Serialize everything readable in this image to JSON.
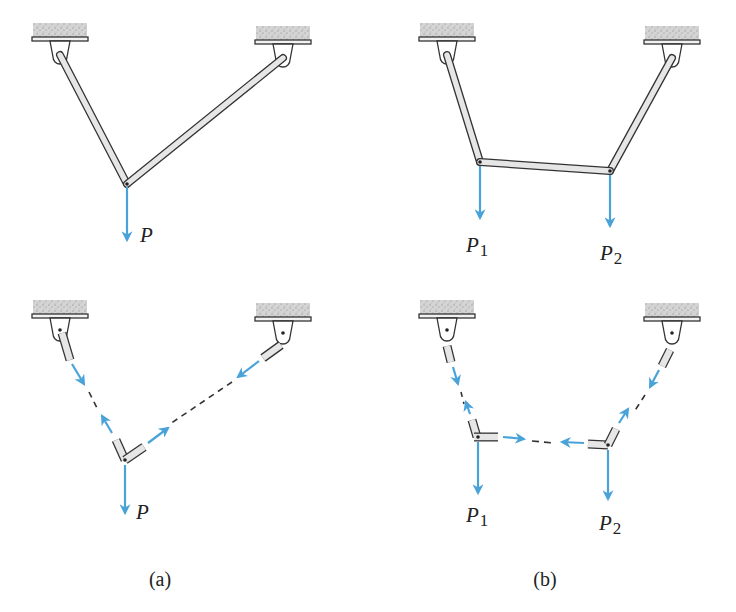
{
  "figure": {
    "colors": {
      "force_arrow": "#4aa3d8",
      "member_fill": "#e6e6e6",
      "member_stroke": "#333333",
      "ceiling_fill": "#d8d8d8"
    },
    "panels": [
      {
        "id": "a",
        "caption": "(a)",
        "top": {
          "loads": [
            {
              "label": "P",
              "subscript": ""
            }
          ]
        },
        "bottom": {
          "loads": [
            {
              "label": "P",
              "subscript": ""
            }
          ]
        }
      },
      {
        "id": "b",
        "caption": "(b)",
        "top": {
          "loads": [
            {
              "label": "P",
              "subscript": "1"
            },
            {
              "label": "P",
              "subscript": "2"
            }
          ]
        },
        "bottom": {
          "loads": [
            {
              "label": "P",
              "subscript": "1"
            },
            {
              "label": "P",
              "subscript": "2"
            }
          ]
        }
      }
    ]
  }
}
